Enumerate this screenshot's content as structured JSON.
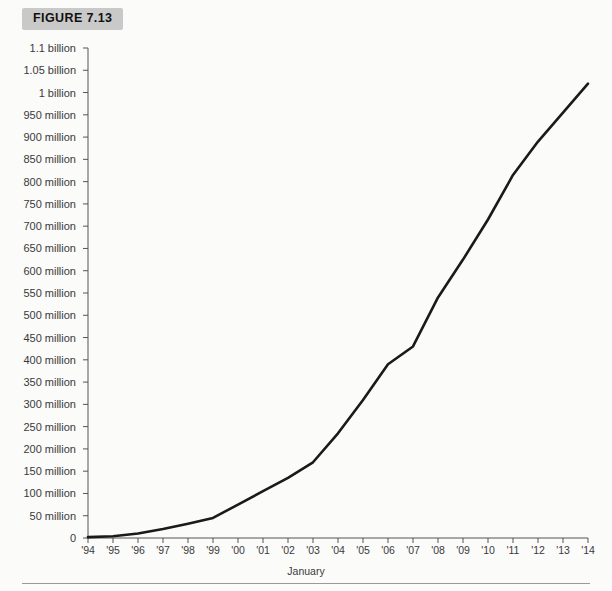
{
  "figure": {
    "label": "FIGURE 7.13",
    "badge_color": "#c9c9c9"
  },
  "axis": {
    "x_title": "January"
  },
  "chart_data": {
    "type": "line",
    "title": "FIGURE 7.13",
    "xlabel": "January",
    "ylabel": "",
    "grid": false,
    "legend": "none",
    "line_color": "#1a1a1a",
    "x": [
      "'94",
      "'95",
      "'96",
      "'97",
      "'98",
      "'99",
      "'00",
      "'01",
      "'02",
      "'03",
      "'04",
      "'05",
      "'06",
      "'07",
      "'08",
      "'09",
      "'10",
      "'11",
      "'12",
      "'13",
      "'14"
    ],
    "values": [
      2000000,
      5000000,
      15000000,
      30000000,
      60000000,
      100000000,
      150000000,
      200000000,
      260000000,
      340000000,
      400000000,
      430000000,
      500000000,
      590000000,
      680000000,
      770000000,
      850000000,
      900000000,
      940000000,
      980000000,
      1020000000
    ],
    "ylim": [
      0,
      1100000000
    ],
    "ytick_values": [
      0,
      50000000,
      100000000,
      150000000,
      200000000,
      250000000,
      300000000,
      350000000,
      400000000,
      450000000,
      500000000,
      550000000,
      600000000,
      650000000,
      700000000,
      750000000,
      800000000,
      850000000,
      900000000,
      950000000,
      1000000000,
      1050000000,
      1100000000
    ],
    "ytick_labels": [
      "0",
      "50 million",
      "100 million",
      "150 million",
      "200 million",
      "250 million",
      "300 million",
      "350 million",
      "400 million",
      "450 million",
      "500 million",
      "550 million",
      "600 million",
      "650 million",
      "700 million",
      "750 million",
      "800 million",
      "850 million",
      "900 million",
      "950 million",
      "1 billion",
      "1.05 billion",
      "1.1 billion"
    ],
    "series_points": [
      {
        "x": "'94",
        "y": 2000000
      },
      {
        "x": "'95",
        "y": 4000000
      },
      {
        "x": "'96",
        "y": 10000000
      },
      {
        "x": "'97",
        "y": 20000000
      },
      {
        "x": "'98",
        "y": 32000000
      },
      {
        "x": "'99",
        "y": 45000000
      },
      {
        "x": "'00",
        "y": 75000000
      },
      {
        "x": "'01",
        "y": 105000000
      },
      {
        "x": "'02",
        "y": 135000000
      },
      {
        "x": "'03",
        "y": 170000000
      },
      {
        "x": "'04",
        "y": 235000000
      },
      {
        "x": "'05",
        "y": 310000000
      },
      {
        "x": "'06",
        "y": 390000000
      },
      {
        "x": "'07",
        "y": 430000000
      },
      {
        "x": "'08",
        "y": 540000000
      },
      {
        "x": "'09",
        "y": 625000000
      },
      {
        "x": "'10",
        "y": 715000000
      },
      {
        "x": "'11",
        "y": 815000000
      },
      {
        "x": "'12",
        "y": 890000000
      },
      {
        "x": "'13",
        "y": 955000000
      },
      {
        "x": "'14",
        "y": 1020000000
      }
    ]
  }
}
